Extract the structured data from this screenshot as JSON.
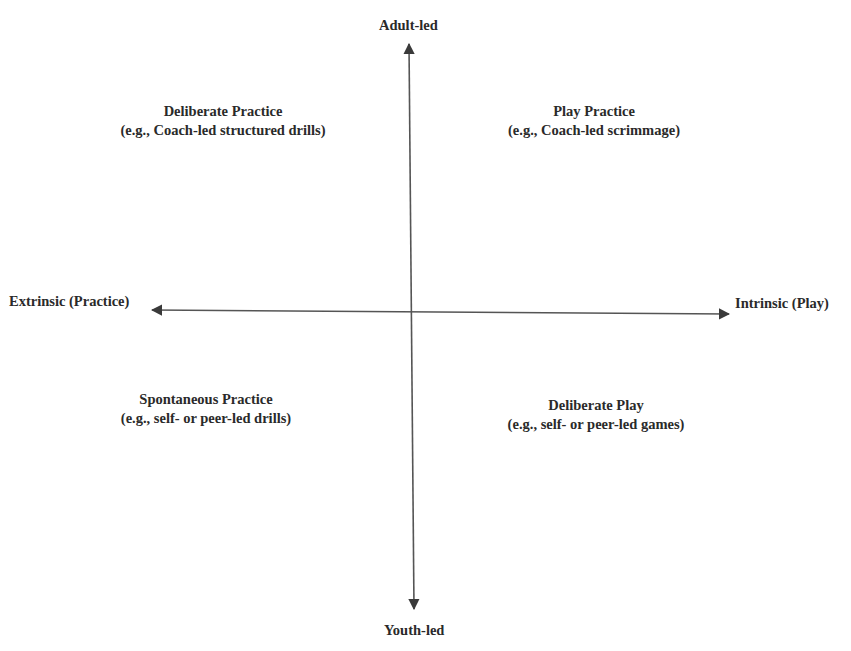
{
  "axes": {
    "vertical": {
      "top_label": "Adult-led",
      "bottom_label": "Youth-led"
    },
    "horizontal": {
      "left_label": "Extrinsic (Practice)",
      "right_label": "Intrinsic (Play)"
    },
    "color": "#3a3a3a"
  },
  "quadrants": {
    "top_left": {
      "title": "Deliberate Practice",
      "example": "(e.g., Coach-led structured drills)"
    },
    "top_right": {
      "title": "Play Practice",
      "example": "(e.g., Coach-led scrimmage)"
    },
    "bottom_left": {
      "title": "Spontaneous Practice",
      "example": "(e.g., self- or peer-led drills)"
    },
    "bottom_right": {
      "title": "Deliberate Play",
      "example": "(e.g., self- or peer-led games)"
    }
  }
}
